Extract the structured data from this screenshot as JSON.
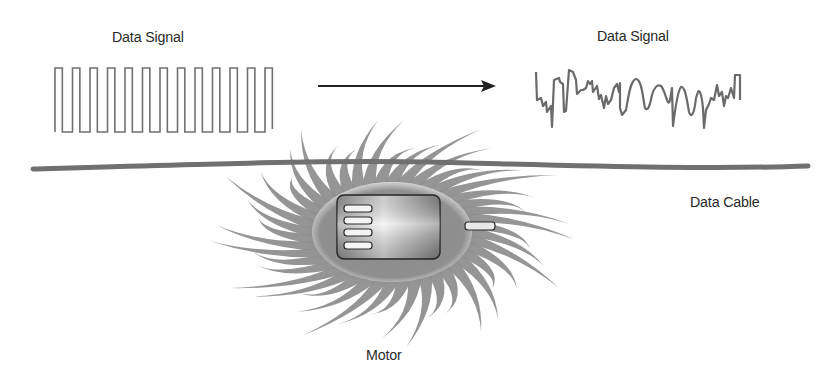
{
  "labels": {
    "input_signal": "Data Signal",
    "output_signal": "Data Signal",
    "cable": "Data Cable",
    "motor": "Motor"
  },
  "colors": {
    "background": "#ffffff",
    "text": "#2a2a2a",
    "signal_line": "#6e6e6e",
    "cable": "#707070",
    "arrow": "#222222",
    "field_rays": "#8a8a8a",
    "motor_outline": "#2a2a2a",
    "motor_body_light": "#f2f2f2",
    "motor_body_dark": "#8e8e8e"
  },
  "diagram": {
    "input_square_wave_cycles": 12,
    "motor_vents": 4,
    "flow_direction": "left-to-right"
  }
}
